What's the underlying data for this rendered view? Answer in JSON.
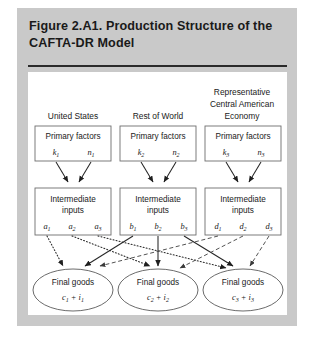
{
  "figure": {
    "title": "Figure 2.A1.  Production Structure of the CAFTA-DR Model",
    "panel_color": "#c9c9c9",
    "content_color": "#ffffff",
    "rule_color": "#2a2a2a"
  },
  "columns": [
    {
      "header": "United States",
      "header_lines": [
        "United States"
      ],
      "primary_factors": {
        "label": "Primary factors",
        "vars": [
          {
            "base": "k",
            "sub": "1"
          },
          {
            "base": "n",
            "sub": "1"
          }
        ]
      },
      "intermediate_inputs": {
        "label_line1": "Intermediate",
        "label_line2": "inputs",
        "vars": [
          {
            "base": "a",
            "sub": "1"
          },
          {
            "base": "a",
            "sub": "2"
          },
          {
            "base": "a",
            "sub": "3"
          }
        ]
      },
      "final_goods": {
        "label": "Final goods",
        "expr_c": "c",
        "expr_c_sub": "1",
        "expr_plus": "+",
        "expr_i": "i",
        "expr_i_sub": "1"
      },
      "edge_style": "dotted"
    },
    {
      "header": "Rest of World",
      "header_lines": [
        "Rest of World"
      ],
      "primary_factors": {
        "label": "Primary factors",
        "vars": [
          {
            "base": "k",
            "sub": "2"
          },
          {
            "base": "n",
            "sub": "2"
          }
        ]
      },
      "intermediate_inputs": {
        "label_line1": "Intermediate",
        "label_line2": "inputs",
        "vars": [
          {
            "base": "b",
            "sub": "1"
          },
          {
            "base": "b",
            "sub": "2"
          },
          {
            "base": "b",
            "sub": "3"
          }
        ]
      },
      "final_goods": {
        "label": "Final goods",
        "expr_c": "c",
        "expr_c_sub": "2",
        "expr_plus": "+",
        "expr_i": "i",
        "expr_i_sub": "2"
      },
      "edge_style": "solid"
    },
    {
      "header": "Representative Central American Economy",
      "header_lines": [
        "Representative",
        "Central American",
        "Economy"
      ],
      "primary_factors": {
        "label": "Primary factors",
        "vars": [
          {
            "base": "k",
            "sub": "3"
          },
          {
            "base": "n",
            "sub": "3"
          }
        ]
      },
      "intermediate_inputs": {
        "label_line1": "Intermediate",
        "label_line2": "inputs",
        "vars": [
          {
            "base": "d",
            "sub": "1"
          },
          {
            "base": "d",
            "sub": "2"
          },
          {
            "base": "d",
            "sub": "3"
          }
        ]
      },
      "final_goods": {
        "label": "Final goods",
        "expr_c": "c",
        "expr_c_sub": "3",
        "expr_plus": "+",
        "expr_i": "i",
        "expr_i_sub": "3"
      },
      "edge_style": "dashed"
    }
  ]
}
